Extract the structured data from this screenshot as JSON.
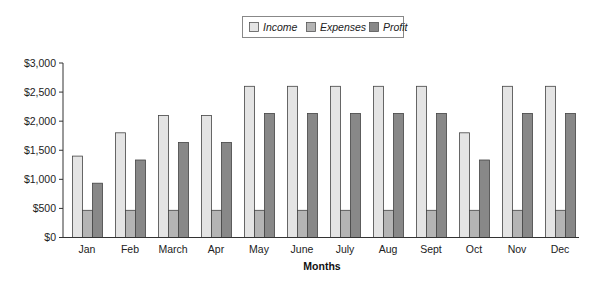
{
  "chart_data": {
    "type": "bar",
    "title": "",
    "xlabel": "Months",
    "ylabel": "",
    "categories": [
      "Jan",
      "Feb",
      "March",
      "Apr",
      "May",
      "June",
      "July",
      "Aug",
      "Sept",
      "Oct",
      "Nov",
      "Dec"
    ],
    "series": [
      {
        "name": "Income",
        "color": "#e4e4e4",
        "values": [
          1400,
          1800,
          2100,
          2100,
          2600,
          2600,
          2600,
          2600,
          2600,
          1800,
          2600,
          2600
        ]
      },
      {
        "name": "Expenses",
        "color": "#b4b4b4",
        "values": [
          467,
          467,
          467,
          467,
          467,
          467,
          467,
          467,
          467,
          467,
          467,
          467
        ]
      },
      {
        "name": "Profit",
        "color": "#888888",
        "values": [
          933,
          1333,
          1633,
          1633,
          2133,
          2133,
          2133,
          2133,
          2133,
          1333,
          2133,
          2133
        ]
      }
    ],
    "ylim": [
      0,
      3000
    ],
    "yticks": [
      0,
      500,
      1000,
      1500,
      2000,
      2500,
      3000
    ],
    "ytick_labels": [
      "$0",
      "$500",
      "$1,000",
      "$1,500",
      "$2,000",
      "$2,500",
      "$3,000"
    ],
    "grid": false,
    "legend_position": "top-center",
    "bar_outline_color": "#444444",
    "axis_color": "#333333"
  }
}
